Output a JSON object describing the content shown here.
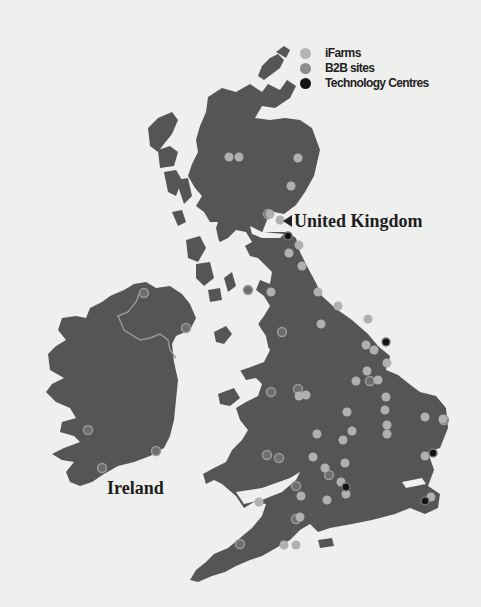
{
  "map": {
    "type": "locations-map",
    "background_color": "#efefed",
    "land_color": "#555555",
    "labels": {
      "uk": "United Kingdom",
      "ireland": "Ireland"
    }
  },
  "legend": {
    "items": [
      {
        "label": "iFarms",
        "color": "#b4b4b4",
        "icon": "light-circle-icon"
      },
      {
        "label": "B2B sites",
        "color": "#8c8c8c",
        "icon": "mid-circle-icon"
      },
      {
        "label": "Technology Centres",
        "color": "#141414",
        "icon": "dark-circle-icon"
      }
    ]
  },
  "markers": {
    "ifarms": [
      [
        229,
        157
      ],
      [
        239,
        157
      ],
      [
        298,
        158
      ],
      [
        291,
        186
      ],
      [
        270,
        214
      ],
      [
        280,
        220
      ],
      [
        299,
        245
      ],
      [
        302,
        266
      ],
      [
        271,
        292
      ],
      [
        289,
        253
      ],
      [
        318,
        292
      ],
      [
        321,
        324
      ],
      [
        338,
        306
      ],
      [
        367,
        371
      ],
      [
        366,
        345
      ],
      [
        368,
        319
      ],
      [
        374,
        350
      ],
      [
        387,
        363
      ],
      [
        378,
        380
      ],
      [
        386,
        397
      ],
      [
        385,
        410
      ],
      [
        387,
        425
      ],
      [
        425,
        417
      ],
      [
        443,
        419
      ],
      [
        425,
        456
      ],
      [
        387,
        434
      ],
      [
        347,
        412
      ],
      [
        343,
        440
      ],
      [
        317,
        434
      ],
      [
        313,
        457
      ],
      [
        341,
        482
      ],
      [
        345,
        463
      ],
      [
        325,
        468
      ],
      [
        301,
        496
      ],
      [
        346,
        494
      ],
      [
        327,
        500
      ],
      [
        300,
        517
      ],
      [
        296,
        545
      ],
      [
        284,
        545
      ],
      [
        259,
        502
      ],
      [
        299,
        396
      ],
      [
        306,
        395
      ],
      [
        352,
        431
      ],
      [
        356,
        381
      ],
      [
        431,
        497
      ]
    ],
    "b2b_sites": [
      [
        268,
        214
      ],
      [
        248,
        290
      ],
      [
        271,
        392
      ],
      [
        282,
        332
      ],
      [
        298,
        389
      ],
      [
        279,
        458
      ],
      [
        296,
        519
      ],
      [
        240,
        544
      ],
      [
        144,
        293
      ],
      [
        186,
        328
      ],
      [
        156,
        451
      ],
      [
        88,
        430
      ],
      [
        102,
        468
      ],
      [
        370,
        381
      ],
      [
        444,
        420
      ],
      [
        329,
        475
      ],
      [
        296,
        486
      ],
      [
        267,
        455
      ]
    ],
    "technology_centres": [
      [
        288,
        236
      ],
      [
        386,
        342
      ],
      [
        433,
        453
      ],
      [
        346,
        487
      ],
      [
        425,
        501
      ]
    ]
  }
}
